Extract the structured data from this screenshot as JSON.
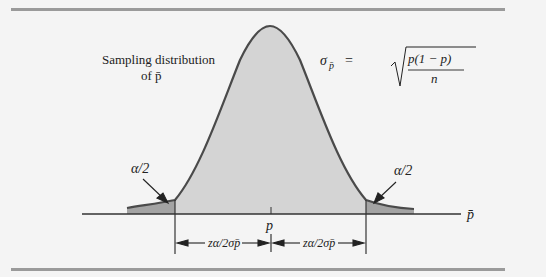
{
  "figure": {
    "title_label_line1": "Sampling distribution",
    "title_label_line2": "of p̄",
    "formula_lhs": "σ",
    "formula_lhs_sub": "p̄",
    "formula_eq": "=",
    "formula_numerator": "p(1 − p)",
    "formula_denominator": "n",
    "left_tail_label": "α/2",
    "right_tail_label": "α/2",
    "axis_label": "p̄",
    "center_label": "p",
    "left_interval_label": "zα/2σp̄",
    "right_interval_label": "zα/2σp̄",
    "colors": {
      "curve_fill": "#d4d4d4",
      "tail_fill": "#a3a3a3",
      "curve_stroke": "#4a4a4a",
      "rule": "#9a9a9a",
      "background": "#f4f4f4"
    }
  }
}
